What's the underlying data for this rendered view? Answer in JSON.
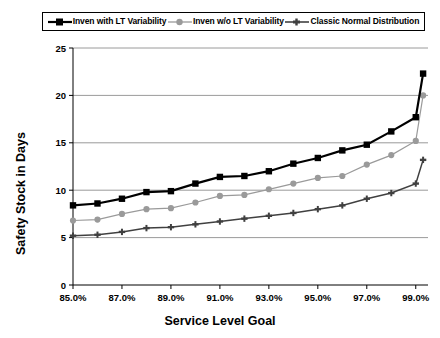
{
  "chart_data": {
    "type": "line",
    "title": "",
    "xlabel": "Service Level Goal",
    "ylabel": "Safety Stock in Days",
    "xlim": [
      85.0,
      99.5
    ],
    "ylim": [
      0,
      25
    ],
    "ytick_labels": [
      "0",
      "5",
      "10",
      "15",
      "20",
      "25"
    ],
    "yticks": [
      0,
      5,
      10,
      15,
      20,
      25
    ],
    "xtick_labels": [
      "85.0%",
      "87.0%",
      "89.0%",
      "91.0%",
      "93.0%",
      "95.0%",
      "97.0%",
      "99.0%"
    ],
    "xticks": [
      85,
      87,
      89,
      91,
      93,
      95,
      97,
      99
    ],
    "grid": "horizontal",
    "legend_position": "top",
    "x": [
      85,
      86,
      87,
      88,
      89,
      90,
      91,
      92,
      93,
      94,
      95,
      96,
      97,
      98,
      99,
      99.3
    ],
    "series": [
      {
        "name": "Inven with LT Variability",
        "color": "#000000",
        "marker": "square",
        "values": [
          8.4,
          8.6,
          9.1,
          9.8,
          9.9,
          10.7,
          11.4,
          11.5,
          12.0,
          12.8,
          13.4,
          14.2,
          14.8,
          16.2,
          17.7,
          22.3
        ]
      },
      {
        "name": "Inven w/o LT Variability",
        "color": "#9a9a9a",
        "marker": "circle",
        "values": [
          6.8,
          6.9,
          7.5,
          8.0,
          8.1,
          8.7,
          9.4,
          9.5,
          10.1,
          10.7,
          11.3,
          11.5,
          12.7,
          13.7,
          15.2,
          20.0
        ]
      },
      {
        "name": "Classic Normal Distribution",
        "color": "#404040",
        "marker": "cross",
        "values": [
          5.2,
          5.3,
          5.6,
          6.0,
          6.1,
          6.4,
          6.7,
          7.0,
          7.3,
          7.6,
          8.0,
          8.4,
          9.1,
          9.7,
          10.7,
          13.2
        ]
      }
    ]
  }
}
